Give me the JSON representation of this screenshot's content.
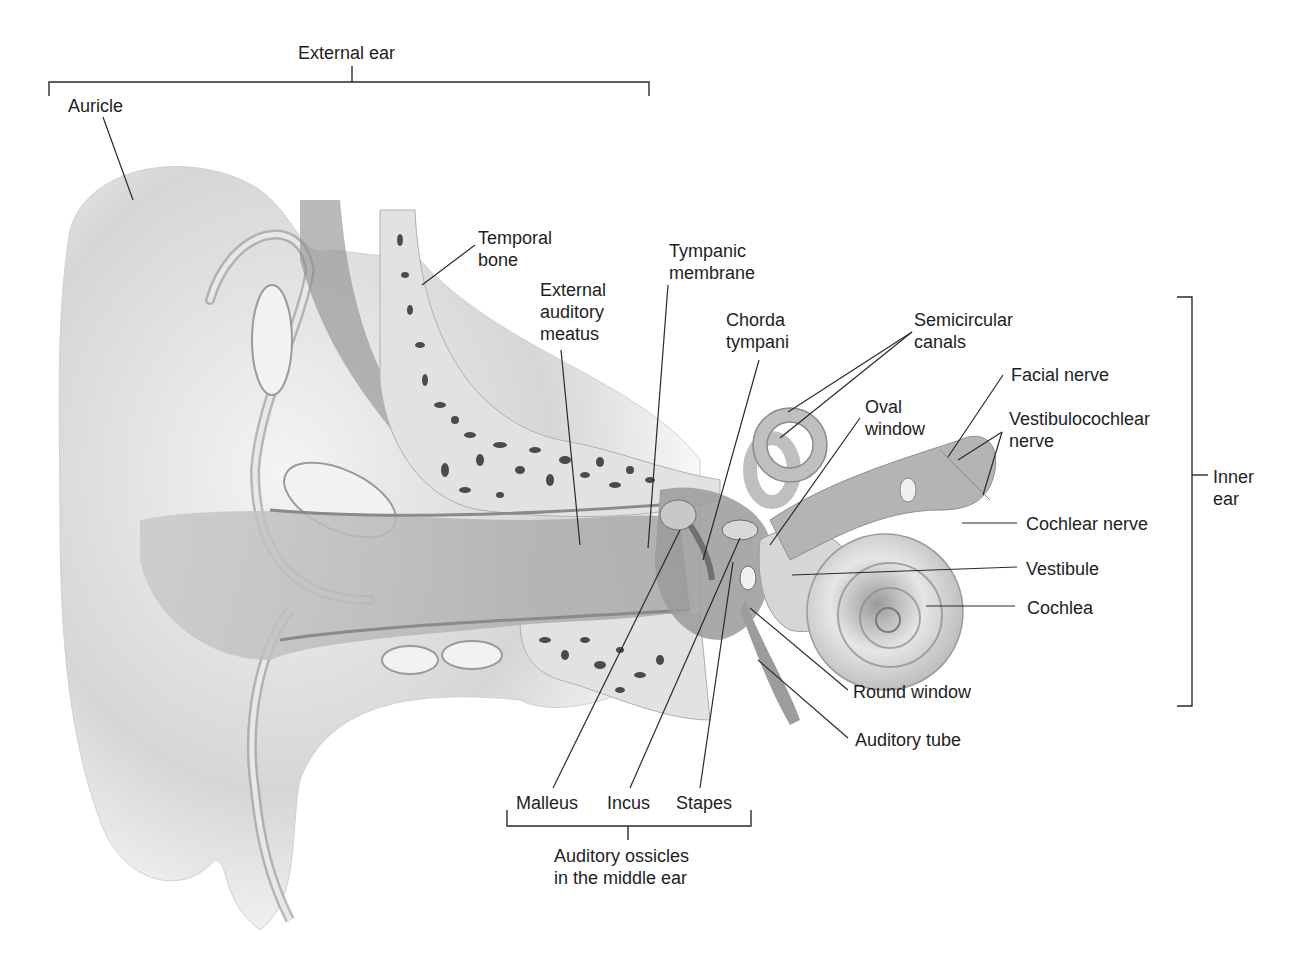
{
  "colors": {
    "text": "#1e1e1e",
    "leader": "#2a2a2a",
    "background": "#ffffff",
    "tissue": "#bdbdbd",
    "bone_pore": "#4a4a4a"
  },
  "groups": {
    "external_ear": "External ear",
    "inner_ear": "Inner\near",
    "ossicles": "Auditory ossicles\nin the middle ear"
  },
  "labels": {
    "auricle": "Auricle",
    "temporal_bone": "Temporal\nbone",
    "external_auditory_meatus": "External\nauditory\nmeatus",
    "tympanic_membrane": "Tympanic\nmembrane",
    "chorda_tympani": "Chorda\ntympani",
    "semicircular_canals": "Semicircular\ncanals",
    "oval_window": "Oval\nwindow",
    "facial_nerve": "Facial nerve",
    "vestibulocochlear_nerve": "Vestibulocochlear\nnerve",
    "cochlear_nerve": "Cochlear nerve",
    "vestibule": "Vestibule",
    "cochlea": "Cochlea",
    "round_window": "Round window",
    "auditory_tube": "Auditory tube",
    "malleus": "Malleus",
    "incus": "Incus",
    "stapes": "Stapes"
  }
}
